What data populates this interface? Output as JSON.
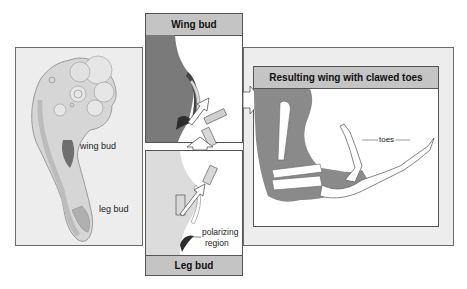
{
  "left_panel": {
    "labels": {
      "wing_bud": "wing bud",
      "leg_bud": "leg bud"
    }
  },
  "center_panel": {
    "top": {
      "title": "Wing bud"
    },
    "bottom": {
      "title": "Leg bud",
      "annotation": [
        "polarizing",
        "region"
      ]
    }
  },
  "right_panel": {
    "title": "Resulting wing with clawed toes",
    "labels": {
      "toes": "toes"
    }
  },
  "colors": {
    "frame_bg": "#ededed",
    "header_bg": "#c4c4c4",
    "tissue_dark": "#7a7a7a",
    "tissue_light": "#dcdcdc",
    "bone": "#ffffff",
    "polarizing_region": "#3a3a3a"
  }
}
